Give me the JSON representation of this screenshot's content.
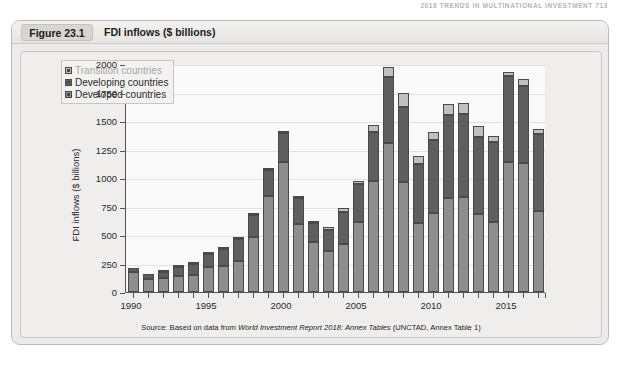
{
  "running_head": "2018  TRENDS IN MULTINATIONAL INVESTMENT     713",
  "figure": {
    "number": "Figure 23.1",
    "title": "FDI inflows ($ billions)"
  },
  "source_note": {
    "prefix": "Source: Based on data from ",
    "italic": "World Investment Report 2018: Annex Tables",
    "suffix": " (UNCTAD, Annex Table 1)"
  },
  "colors": {
    "panel_bg": "#eceaea",
    "card_bg": "#f0eeed",
    "plot_bg": "#fbfafa",
    "developed": "#8e8e8e",
    "developing": "#5f5f5f",
    "transition": "#c0c0c0",
    "axis": "#555555",
    "grid": "#e3e1e0",
    "legend_transition_text": "#a8a6a4",
    "legend_text": "#2a2a2a"
  },
  "legend": {
    "position": "top-left-inside",
    "items": [
      {
        "label": "Transition countries",
        "color": "#c0c0c0",
        "muted": true
      },
      {
        "label": "Developing countries",
        "color": "#5f5f5f",
        "muted": false
      },
      {
        "label": "Developed countries",
        "color": "#8e8e8e",
        "muted": false
      }
    ]
  },
  "chart_data": {
    "type": "bar",
    "stacked": true,
    "title": "FDI inflows ($ billions)",
    "xlabel": "",
    "ylabel": "FDI inflows ($ billions)",
    "ylim": [
      0,
      2000
    ],
    "ytick_step": 250,
    "yticks": [
      0,
      250,
      500,
      750,
      1000,
      1250,
      1500,
      1750,
      2000
    ],
    "ytick_labels": [
      "0",
      "250",
      "500",
      "750",
      "1000",
      "1250",
      "1500",
      "1750",
      "2000"
    ],
    "grid": true,
    "xtick_labels": [
      "1990",
      "1995",
      "2000",
      "2005",
      "2010",
      "2015"
    ],
    "xtick_years": [
      1990,
      1995,
      2000,
      2005,
      2010,
      2015
    ],
    "categories": [
      1990,
      1991,
      1992,
      1993,
      1994,
      1995,
      1996,
      1997,
      1998,
      1999,
      2000,
      2001,
      2002,
      2003,
      2004,
      2005,
      2006,
      2007,
      2008,
      2009,
      2010,
      2011,
      2012,
      2013,
      2014,
      2015,
      2016,
      2017
    ],
    "series": [
      {
        "name": "Developed countries",
        "color": "#8e8e8e",
        "values": [
          172,
          114,
          121,
          144,
          146,
          221,
          228,
          276,
          483,
          845,
          1138,
          601,
          440,
          361,
          418,
          613,
          978,
          1310,
          965,
          606,
          696,
          828,
          835,
          686,
          613,
          1141,
          1133,
          712
        ]
      },
      {
        "name": "Developing countries",
        "color": "#5f5f5f",
        "values": [
          35,
          41,
          51,
          73,
          104,
          115,
          152,
          193,
          191,
          222,
          256,
          220,
          163,
          186,
          283,
          332,
          427,
          574,
          658,
          519,
          637,
          725,
          729,
          671,
          704,
          752,
          670,
          671
        ]
      },
      {
        "name": "Transition countries",
        "color": "#c0c0c0",
        "values": [
          0,
          0,
          3,
          6,
          6,
          8,
          9,
          10,
          6,
          9,
          7,
          10,
          12,
          21,
          35,
          31,
          58,
          91,
          123,
          72,
          75,
          95,
          92,
          100,
          56,
          36,
          68,
          47
        ]
      }
    ],
    "totals": [
      207,
      155,
      175,
      223,
      256,
      344,
      389,
      479,
      680,
      1076,
      1401,
      831,
      615,
      568,
      736,
      976,
      1463,
      1975,
      1746,
      1197,
      1408,
      1648,
      1656,
      1457,
      1373,
      1929,
      1871,
      1430
    ]
  }
}
